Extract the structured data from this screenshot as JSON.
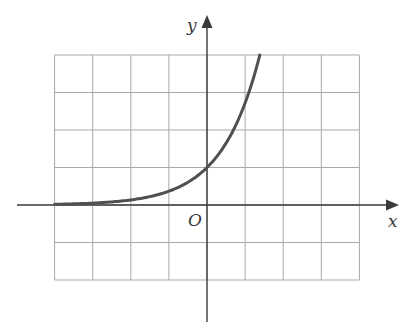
{
  "figure": {
    "x_axis_label": "x",
    "y_axis_label": "y",
    "origin_label": "O",
    "colors": {
      "grid": "#a9a9a9",
      "axes": "#3a3a3a",
      "curve": "#505050",
      "background": "#ffffff"
    }
  },
  "chart_data": {
    "type": "line",
    "title": "",
    "xlabel": "x",
    "ylabel": "y",
    "function": "y = e^x",
    "grid": true,
    "xlim": [
      -4,
      4
    ],
    "ylim": [
      -2,
      4
    ],
    "grid_step": 1,
    "x": [
      -4,
      -3,
      -2,
      -1,
      0,
      0.5,
      1,
      1.25,
      1.386
    ],
    "series": [
      {
        "name": "y = e^x",
        "values": [
          0.018,
          0.05,
          0.135,
          0.368,
          1,
          1.649,
          2.718,
          3.49,
          4.0
        ]
      }
    ],
    "annotations": [
      "O at origin"
    ]
  }
}
